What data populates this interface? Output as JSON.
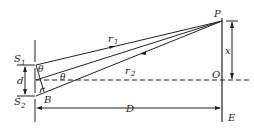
{
  "diagram": {
    "labels": {
      "S1": "S",
      "S1_sub": "1",
      "S2": "S",
      "S2_sub": "2",
      "P": "P",
      "O": "O",
      "E": "E",
      "B": "B",
      "D": "D",
      "d": "d",
      "x": "x",
      "r1": "r",
      "r1_sub": "1",
      "r2": "r",
      "r2_sub": "2",
      "theta_top": "θ",
      "theta_mid": "θ"
    },
    "colors": {
      "line": "#222222",
      "background": "#ffffff"
    }
  }
}
